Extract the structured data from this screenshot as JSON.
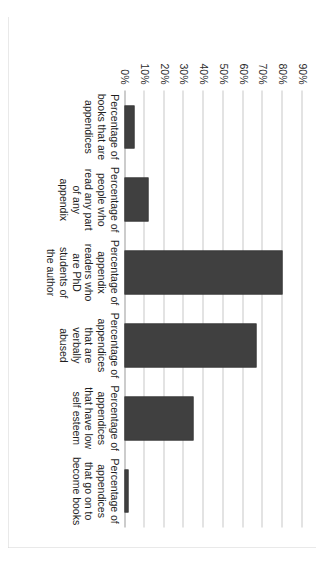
{
  "chart_data": {
    "type": "bar",
    "orientation": "vertical-rendered-rotated",
    "title": "",
    "xlabel": "",
    "ylabel": "",
    "ylim": [
      0,
      90
    ],
    "ytick_step": 10,
    "grid": true,
    "legend": "none",
    "bar_color": "#404040",
    "plot_background": "#ffffff",
    "border_color": "#d3d3d3",
    "gridline_color": "#c8c8c8",
    "categories": [
      "Percentage of books that are appendices",
      "Percentage of people who read any part of any appendix",
      "Percentage of appendix readers who are PhD students of the author",
      "Percentage of appendices that are verbally abused",
      "Percentage of appendices that have low self esteem",
      "Percentage of appendices that go on to become books"
    ],
    "category_lines": [
      [
        "Percentage of",
        "books that are",
        "appendices"
      ],
      [
        "Percentage of",
        "people who",
        "read any part",
        "of any",
        "appendix"
      ],
      [
        "Percentage of",
        "appendix",
        "readers who",
        "are PhD",
        "students of",
        "the author"
      ],
      [
        "Percentage of",
        "appendices",
        "that are",
        "verbally",
        "abused"
      ],
      [
        "Percentage of",
        "appendices",
        "that have low",
        "self esteem"
      ],
      [
        "Percentage of",
        "appendices",
        "that go on to",
        "become books"
      ]
    ],
    "values": [
      5,
      12,
      80,
      67,
      35,
      2
    ],
    "ticks": [
      {
        "value": 90,
        "label": "90%"
      },
      {
        "value": 80,
        "label": "80%"
      },
      {
        "value": 70,
        "label": "70%"
      },
      {
        "value": 60,
        "label": "60%"
      },
      {
        "value": 50,
        "label": "50%"
      },
      {
        "value": 40,
        "label": "40%"
      },
      {
        "value": 30,
        "label": "30%"
      },
      {
        "value": 20,
        "label": "20%"
      },
      {
        "value": 10,
        "label": "10%"
      },
      {
        "value": 0,
        "label": "0%"
      }
    ]
  }
}
